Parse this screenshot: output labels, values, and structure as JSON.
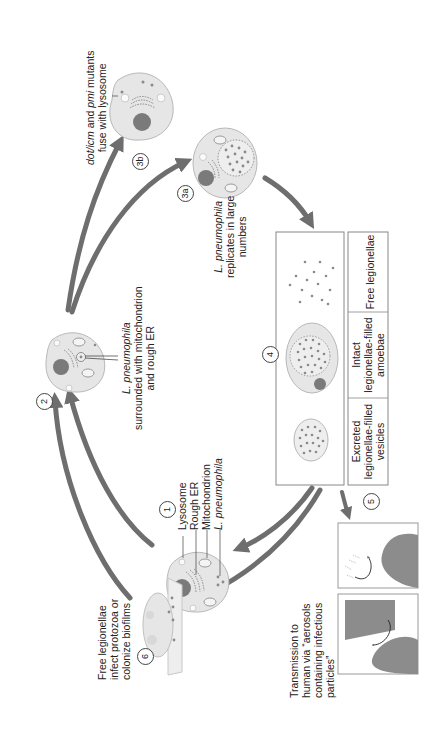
{
  "diagram": {
    "orientation": "rotated-90-ccw",
    "colors": {
      "arrow": "#6e6e6e",
      "cell_fill": "#e6e6e6",
      "cell_stroke": "#b8b8b8",
      "nucleus": "#7a7a7a",
      "bacteria": "#8a8a8a",
      "box_stroke": "#888888",
      "silhouette": "#8c8c8c"
    },
    "steps": [
      {
        "id": "1",
        "label": "1"
      },
      {
        "id": "2",
        "label": "2"
      },
      {
        "id": "3a",
        "label": "3a"
      },
      {
        "id": "3b",
        "label": "3b"
      },
      {
        "id": "4",
        "label": "4"
      },
      {
        "id": "5",
        "label": "5"
      },
      {
        "id": "6",
        "label": "6"
      }
    ],
    "step1_legend": {
      "lysosome": "Lysosome",
      "rough_er": "Rough ER",
      "mitochondrion": "Mitochondrion",
      "l_pneumophila": "L. pneumophila"
    },
    "step2_caption": {
      "line1": "L. pneumophila",
      "line2": "surrounded with mitochondrion",
      "line3": "and rough ER"
    },
    "step3a_caption": {
      "line1": "L. pneumophila",
      "line2": "replicates in large",
      "line3": "numbers"
    },
    "step3b_caption": {
      "line1_italic_a": "dot/icm",
      "line1_mid": " and ",
      "line1_italic_b": "pmi",
      "line1_end": " mutants",
      "line2": "fuse with lysosome"
    },
    "step4_panels": [
      {
        "line1": "Excreted",
        "line2": "legionellae-filled",
        "line3": "vesicles"
      },
      {
        "line1": "Intact",
        "line2": "legionellae-filled",
        "line3": "amoebae"
      },
      {
        "line1": "Free legionellae"
      }
    ],
    "step5_caption": {
      "line1": "Transmission to",
      "line2": "human via “aerosols",
      "line3": "containing infectious",
      "line4": "particles”"
    },
    "step6_caption": {
      "line1": "Free legionellae",
      "line2": "infect protozoa or",
      "line3": "colonize biofilms"
    }
  }
}
